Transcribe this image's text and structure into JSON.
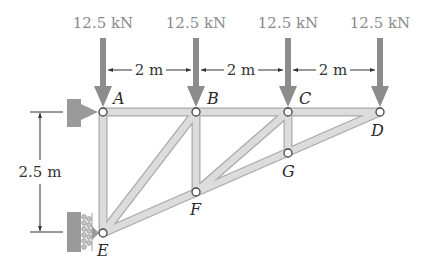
{
  "figure": {
    "type": "truss-diagram",
    "colors": {
      "member_fill": "#d6d6d6",
      "member_edge": "#a9a9a9",
      "load_arrow": "#8c8c8c",
      "support": "#9a9a9a",
      "node_fill": "#ffffff",
      "node_edge": "#444444",
      "dimension_line": "#333333"
    },
    "loads": [
      {
        "joint": "A",
        "label": "12.5 kN"
      },
      {
        "joint": "B",
        "label": "12.5 kN"
      },
      {
        "joint": "C",
        "label": "12.5 kN"
      },
      {
        "joint": "D",
        "label": "12.5 kN"
      }
    ],
    "dimensions": {
      "spans": [
        {
          "from": "A",
          "to": "B",
          "label": "2 m"
        },
        {
          "from": "B",
          "to": "C",
          "label": "2 m"
        },
        {
          "from": "C",
          "to": "D",
          "label": "2 m"
        }
      ],
      "height": {
        "from": "A",
        "to": "E",
        "label": "2.5 m"
      }
    },
    "joints": [
      {
        "name": "A",
        "label": "A"
      },
      {
        "name": "B",
        "label": "B"
      },
      {
        "name": "C",
        "label": "C"
      },
      {
        "name": "D",
        "label": "D"
      },
      {
        "name": "E",
        "label": "E"
      },
      {
        "name": "F",
        "label": "F"
      },
      {
        "name": "G",
        "label": "G"
      }
    ],
    "members": [
      [
        "A",
        "B"
      ],
      [
        "B",
        "C"
      ],
      [
        "C",
        "D"
      ],
      [
        "A",
        "E"
      ],
      [
        "B",
        "F"
      ],
      [
        "C",
        "G"
      ],
      [
        "E",
        "B"
      ],
      [
        "F",
        "C"
      ],
      [
        "E",
        "F"
      ],
      [
        "F",
        "G"
      ],
      [
        "G",
        "D"
      ]
    ],
    "supports": [
      {
        "joint": "A",
        "type": "pin"
      },
      {
        "joint": "E",
        "type": "roller"
      }
    ]
  }
}
